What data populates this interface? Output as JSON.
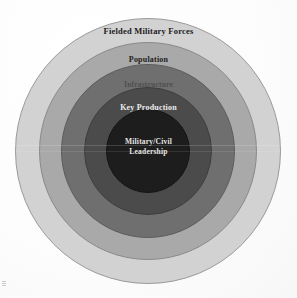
{
  "figure": {
    "background_color": "#fdfdfd"
  },
  "chart_data": {
    "type": "pie",
    "subtype": "concentric-rings",
    "title": "",
    "xlabel": "",
    "ylabel": "",
    "legend_position": "none",
    "grid": false,
    "center": {
      "x": 148,
      "y": 151
    },
    "rings": [
      {
        "index": 1,
        "label": "Fielded Military Forces",
        "fill": "#d2d2d2",
        "stroke": "#9a9a9a",
        "text_color": "#23201c",
        "outer_diameter": 266,
        "outer_radius": 133
      },
      {
        "index": 2,
        "label": "Population",
        "fill": "#a9a9a9",
        "stroke": "#8a8a8a",
        "text_color": "#1f1d1a",
        "outer_diameter": 218,
        "outer_radius": 109
      },
      {
        "index": 3,
        "label": "Infrastructure",
        "fill": "#6f6f6f",
        "stroke": "#5d5d5d",
        "text_color": "#4a4a4a",
        "outer_diameter": 174,
        "outer_radius": 87
      },
      {
        "index": 4,
        "label": "Key Production",
        "fill": "#4b4b4b",
        "stroke": "#3e3e3e",
        "text_color": "#ececec",
        "outer_diameter": 128,
        "outer_radius": 64
      },
      {
        "index": 5,
        "label": "Military/Civil Leadership",
        "label_line1": "Military/Civil",
        "label_line2": "Leadership",
        "fill": "#1d1d1d",
        "stroke": "#141414",
        "text_color": "#e6e6e6",
        "outer_diameter": 84,
        "outer_radius": 42
      }
    ]
  }
}
